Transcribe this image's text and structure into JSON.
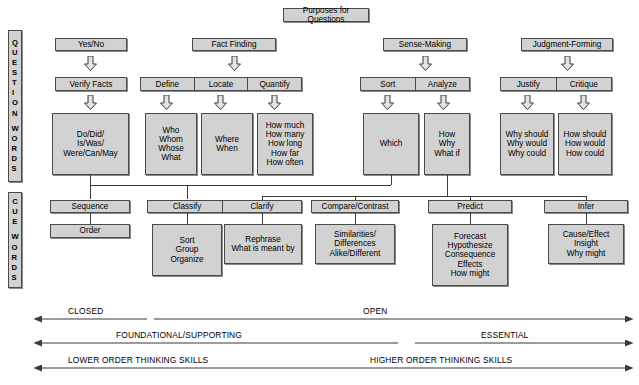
{
  "title": {
    "label": "Purposes for Questions"
  },
  "rails": [
    {
      "name": "question-words",
      "letters": [
        "Q",
        "U",
        "E",
        "S",
        "T",
        "I",
        "O",
        "N",
        "",
        "W",
        "O",
        "R",
        "D",
        "S"
      ],
      "text": "QUESTION WORDS"
    },
    {
      "name": "cue-words",
      "letters": [
        "C",
        "U",
        "E",
        "",
        "W",
        "O",
        "R",
        "D",
        "S"
      ],
      "text": "CUE WORDS"
    }
  ],
  "question_words": {
    "purposes": [
      {
        "label": "Yes/No"
      },
      {
        "label": "Fact Finding"
      },
      {
        "label": "Sense-Making"
      },
      {
        "label": "Judgment-Forming"
      }
    ],
    "categories": [
      {
        "group": "Yes/No",
        "cells": [
          "Verify Facts"
        ]
      },
      {
        "group": "Fact Finding",
        "cells": [
          "Define",
          "Locate",
          "Quantify"
        ]
      },
      {
        "group": "Sense-Making",
        "cells": [
          "Sort",
          "Analyze"
        ]
      },
      {
        "group": "Judgment-Forming",
        "cells": [
          "Justify",
          "Critique"
        ]
      }
    ],
    "word_boxes": [
      {
        "for": "Verify Facts",
        "words": [
          "Do/Did/",
          "Is/Was/",
          "Were/Can/May"
        ]
      },
      {
        "for": "Define",
        "words": [
          "Who",
          "Whom",
          "Whose",
          "What"
        ]
      },
      {
        "for": "Locate",
        "words": [
          "Where",
          "When"
        ]
      },
      {
        "for": "Quantify",
        "words": [
          "How much",
          "How many",
          "How long",
          "How far",
          "How often"
        ]
      },
      {
        "for": "Sort",
        "words": [
          "Which"
        ]
      },
      {
        "for": "Analyze",
        "words": [
          "How",
          "Why",
          "What if"
        ]
      },
      {
        "for": "Justify",
        "words": [
          "Why should",
          "Why would",
          "Why could"
        ]
      },
      {
        "for": "Critique",
        "words": [
          "How should",
          "How would",
          "How could"
        ]
      }
    ]
  },
  "cue_words": {
    "headers": [
      {
        "label": "Sequence"
      },
      {
        "label": "Classify"
      },
      {
        "label": "Clarify"
      },
      {
        "label": "Compare/Contrast"
      },
      {
        "label": "Predict"
      },
      {
        "label": "Infer"
      }
    ],
    "bodies": [
      {
        "for": "Sequence",
        "words": [
          "Order"
        ]
      },
      {
        "for": "Classify",
        "words": [
          "Sort",
          "Group",
          "Organize"
        ]
      },
      {
        "for": "Clarify",
        "words": [
          "Rephrase",
          "What is meant by"
        ]
      },
      {
        "for": "Compare/Contrast",
        "words": [
          "Similarities/",
          "Differences",
          "Alike/Different"
        ]
      },
      {
        "for": "Predict",
        "words": [
          "Forecast",
          "Hypothesize",
          "Consequence",
          "Effects",
          "How might"
        ]
      },
      {
        "for": "Infer",
        "words": [
          "Cause/Effect",
          "Insight",
          "Why might"
        ]
      }
    ]
  },
  "continuum": [
    {
      "left_label": "CLOSED",
      "right_label": "OPEN"
    },
    {
      "left_label": "FOUNDATIONAL/SUPPORTING",
      "right_label": "ESSENTIAL"
    },
    {
      "left_label": "LOWER ORDER THINKING SKILLS",
      "right_label": "HIGHER ORDER THINKING SKILLS"
    }
  ],
  "colors": {
    "box_fill": "#d2d2d2",
    "box_border": "#4a4a4a",
    "line": "#3a3a3a",
    "background": "#ffffff"
  }
}
